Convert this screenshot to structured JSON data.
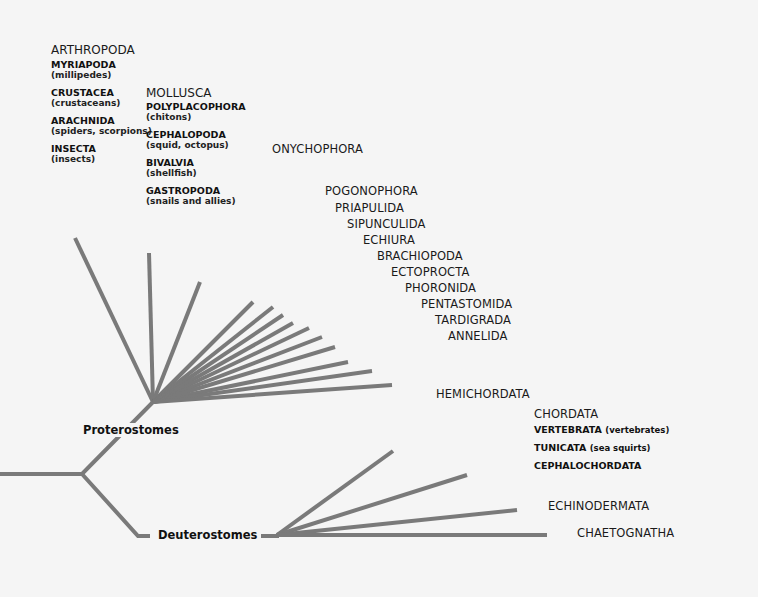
{
  "diagram": {
    "line_color": "#7a7a7a",
    "background": "#f5f5f5",
    "clades": {
      "proterostomes": "Proterostomes",
      "deuterostomes": "Deuterostomes"
    },
    "arthropoda": {
      "title": "ARTHROPODA",
      "groups": [
        {
          "name": "MYRIAPODA",
          "common": "(millipedes)"
        },
        {
          "name": "CRUSTACEA",
          "common": "(crustaceans)"
        },
        {
          "name": "ARACHNIDA",
          "common": "(spiders, scorpions)"
        },
        {
          "name": "INSECTA",
          "common": "(insects)"
        }
      ]
    },
    "mollusca": {
      "title": "MOLLUSCA",
      "groups": [
        {
          "name": "POLYPLACOPHORA",
          "common": "(chitons)"
        },
        {
          "name": "CEPHALOPODA",
          "common": "(squid, octopus)"
        },
        {
          "name": "BIVALVIA",
          "common": "(shellfish)"
        },
        {
          "name": "GASTROPODA",
          "common": "(snails and allies)"
        }
      ]
    },
    "proterostome_phyla": [
      "ONYCHOPHORA",
      "POGONOPHORA",
      "PRIAPULIDA",
      "SIPUNCULIDA",
      "ECHIURA",
      "BRACHIOPODA",
      "ECTOPROCTA",
      "PHORONIDA",
      "PENTASTOMIDA",
      "TARDIGRADA",
      "ANNELIDA"
    ],
    "deuterostome_phyla": {
      "hemichordata": "HEMICHORDATA",
      "chordata": {
        "title": "CHORDATA",
        "groups": [
          {
            "name": "VERTEBRATA",
            "common": "(vertebrates)"
          },
          {
            "name": "TUNICATA",
            "common": "(sea squirts)"
          },
          {
            "name": "CEPHALOCHORDATA",
            "common": ""
          }
        ]
      },
      "echinodermata": "ECHINODERMATA",
      "chaetognatha": "CHAETOGNATHA"
    }
  }
}
